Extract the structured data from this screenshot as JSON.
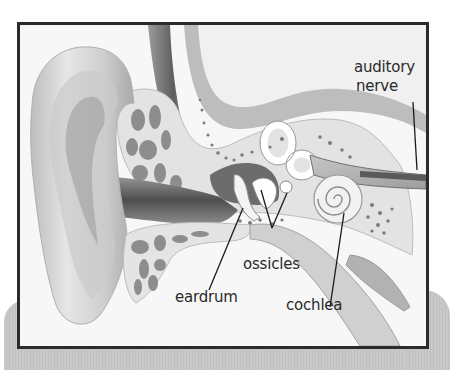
{
  "diagram": {
    "labels": {
      "auditory_nerve_line1": "auditory",
      "auditory_nerve_line2": "nerve",
      "ossicles": "ossicles",
      "eardrum": "eardrum",
      "cochlea": "cochlea"
    },
    "colors": {
      "frame_border": "#2b2b2b",
      "backdrop": "#c6c6c6",
      "bone": "#e2e2e2",
      "bone_pores": "#8a8a8a",
      "skin": "#d6d6d6",
      "canal_dark": "#5a5a5a",
      "leader_lines": "#1a1a1a"
    }
  }
}
